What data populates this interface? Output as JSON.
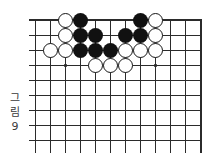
{
  "figure_label": {
    "text": "그림 9",
    "chars": [
      "그",
      "림",
      "9"
    ]
  },
  "colors": {
    "background": "#ffffff",
    "line": "#2b2b2b",
    "black_stone": "#111111",
    "white_stone": "#ffffff",
    "stone_border": "#161616",
    "label_text": "#3a3a3a"
  },
  "board": {
    "grid": {
      "col_count": 12,
      "row_count": 9,
      "col_start": 35,
      "col_spacing": 15.09,
      "row_start": 20,
      "row_spacing": 15,
      "h_line_left": 29,
      "h_line_right": 202,
      "v_line_bottom": 153,
      "top_edge_thick": 2,
      "right_edge_thick": 2,
      "inner_line_thick": 1
    },
    "star_points": [
      {
        "col": 3,
        "row": 4
      },
      {
        "col": 9,
        "row": 4
      }
    ],
    "stones": [
      {
        "col": 3,
        "row": 1,
        "color": "white"
      },
      {
        "col": 4,
        "row": 1,
        "color": "black"
      },
      {
        "col": 8,
        "row": 1,
        "color": "black"
      },
      {
        "col": 9,
        "row": 1,
        "color": "white"
      },
      {
        "col": 3,
        "row": 2,
        "color": "white"
      },
      {
        "col": 4,
        "row": 2,
        "color": "black"
      },
      {
        "col": 5,
        "row": 2,
        "color": "black"
      },
      {
        "col": 7,
        "row": 2,
        "color": "black"
      },
      {
        "col": 8,
        "row": 2,
        "color": "black"
      },
      {
        "col": 9,
        "row": 2,
        "color": "white"
      },
      {
        "col": 2,
        "row": 3,
        "color": "white"
      },
      {
        "col": 3,
        "row": 3,
        "color": "white"
      },
      {
        "col": 4,
        "row": 3,
        "color": "black"
      },
      {
        "col": 5,
        "row": 3,
        "color": "black"
      },
      {
        "col": 6,
        "row": 3,
        "color": "black"
      },
      {
        "col": 7,
        "row": 3,
        "color": "white"
      },
      {
        "col": 8,
        "row": 3,
        "color": "white"
      },
      {
        "col": 9,
        "row": 3,
        "color": "white"
      },
      {
        "col": 5,
        "row": 4,
        "color": "white"
      },
      {
        "col": 6,
        "row": 4,
        "color": "white"
      },
      {
        "col": 7,
        "row": 4,
        "color": "white"
      }
    ],
    "stone_diameter": 15
  }
}
